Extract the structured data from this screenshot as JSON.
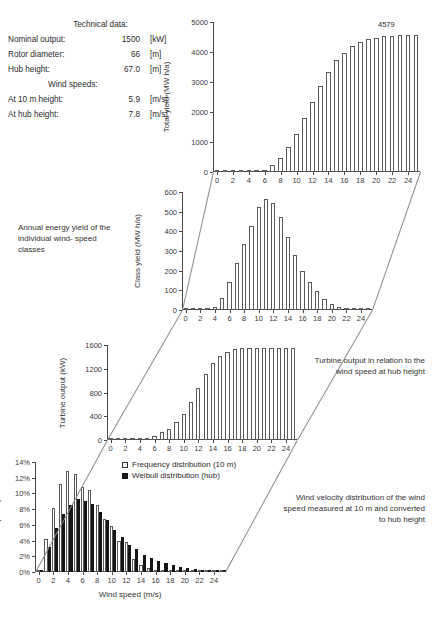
{
  "technical_data": {
    "heading": "Technical data:",
    "rows": [
      {
        "label": "Nominal output:",
        "value": "1500",
        "unit": "[kW]"
      },
      {
        "label": "Rotor diameter:",
        "value": "66",
        "unit": "[m]"
      },
      {
        "label": "Hub height:",
        "value": "67.0",
        "unit": "[m]"
      }
    ],
    "wind_heading": "Wind speeds:",
    "wind_rows": [
      {
        "label": "At 10 m height:",
        "value": "5.9",
        "unit": "[m/s]"
      },
      {
        "label": "At hub height:",
        "value": "7.8",
        "unit": "[m/s]"
      }
    ]
  },
  "notes": {
    "annual_energy": "Annual energy\nyield of the\nindividual wind-\nspeed classes",
    "turbine_output": "Turbine output\nin relation to\nthe wind speed\nat hub height",
    "wind_velocity": "Wind velocity distribution of\nthe wind speed measured\nat 10 m and converted\nto hub height"
  },
  "legend": {
    "frequency_label": "Frequency distribution (10 m)",
    "weibull_label": "Weibull distribution (hub)",
    "frequency_color": "#ffffff",
    "weibull_color": "#151515"
  },
  "chart_data": [
    {
      "id": "total-yield",
      "type": "bar",
      "title": "",
      "xlabel": "",
      "ylabel": "Total yield (MW h/a)",
      "ylim": [
        0,
        5000
      ],
      "yticks": [
        0,
        1000,
        2000,
        3000,
        4000,
        5000
      ],
      "xlim": [
        -0.5,
        25.5
      ],
      "xticks": [
        0,
        2,
        4,
        6,
        8,
        10,
        12,
        14,
        16,
        18,
        20,
        22,
        24
      ],
      "grid": false,
      "annotation": "4579",
      "categories": [
        0,
        1,
        2,
        3,
        4,
        5,
        6,
        7,
        8,
        9,
        10,
        11,
        12,
        13,
        14,
        15,
        16,
        17,
        18,
        19,
        20,
        21,
        22,
        23,
        24,
        25
      ],
      "values": [
        0,
        0,
        1,
        3,
        8,
        24,
        78,
        218,
        455,
        830,
        1270,
        1800,
        2340,
        2880,
        3350,
        3720,
        3980,
        4190,
        4330,
        4420,
        4480,
        4520,
        4545,
        4560,
        4572,
        4579
      ]
    },
    {
      "id": "class-yield",
      "type": "bar",
      "title": "",
      "xlabel": "",
      "ylabel": "Class yield (MW h/a)",
      "ylim": [
        0,
        600
      ],
      "yticks": [
        0,
        100,
        200,
        300,
        400,
        500,
        600
      ],
      "xlim": [
        -0.5,
        25.5
      ],
      "xticks": [
        0,
        2,
        4,
        6,
        8,
        10,
        12,
        14,
        16,
        18,
        20,
        22,
        24
      ],
      "grid": false,
      "categories": [
        0,
        1,
        2,
        3,
        4,
        5,
        6,
        7,
        8,
        9,
        10,
        11,
        12,
        13,
        14,
        15,
        16,
        17,
        18,
        19,
        20,
        21,
        22,
        23,
        24,
        25
      ],
      "values": [
        0,
        1,
        2,
        5,
        17,
        62,
        140,
        238,
        335,
        428,
        525,
        565,
        545,
        472,
        372,
        278,
        200,
        140,
        95,
        58,
        30,
        17,
        10,
        7,
        6,
        5
      ]
    },
    {
      "id": "turbine-output",
      "type": "bar",
      "title": "",
      "xlabel": "",
      "ylabel": "Turbine output (kW)",
      "ylim": [
        0,
        1600
      ],
      "yticks": [
        0,
        400,
        800,
        1200,
        1600
      ],
      "xlim": [
        -0.5,
        25.5
      ],
      "xticks": [
        0,
        2,
        4,
        6,
        8,
        10,
        12,
        14,
        16,
        18,
        20,
        22,
        24
      ],
      "grid": false,
      "categories": [
        0,
        1,
        2,
        3,
        4,
        5,
        6,
        7,
        8,
        9,
        10,
        11,
        12,
        13,
        14,
        15,
        16,
        17,
        18,
        19,
        20,
        21,
        22,
        23,
        24,
        25
      ],
      "values": [
        0,
        0,
        0,
        0,
        5,
        20,
        70,
        130,
        190,
        300,
        440,
        640,
        870,
        1120,
        1290,
        1420,
        1490,
        1530,
        1545,
        1545,
        1545,
        1545,
        1545,
        1545,
        1545,
        1545
      ]
    },
    {
      "id": "wind-frequency",
      "type": "bar",
      "title": "",
      "xlabel": "Wind speed (m/s)",
      "ylabel": "Frequency",
      "ylim": [
        0,
        14
      ],
      "yticks": [
        "0%",
        "2%",
        "4%",
        "6%",
        "8%",
        "10%",
        "12%",
        "14%"
      ],
      "ytick_values": [
        0,
        2,
        4,
        6,
        8,
        10,
        12,
        14
      ],
      "xlim": [
        -0.5,
        25.5
      ],
      "xticks": [
        0,
        2,
        4,
        6,
        8,
        10,
        12,
        14,
        16,
        18,
        20,
        22,
        24
      ],
      "grid": false,
      "categories": [
        0,
        1,
        2,
        3,
        4,
        5,
        6,
        7,
        8,
        9,
        10,
        11,
        12,
        13,
        14,
        15,
        16,
        17,
        18,
        19,
        20,
        21,
        22,
        23,
        24,
        25
      ],
      "series": [
        {
          "name": "Frequency distribution (10 m)",
          "values": [
            0.2,
            4.2,
            8.2,
            11.2,
            12.8,
            12.5,
            10.8,
            10.4,
            8.5,
            6.7,
            5.9,
            4.0,
            3.8,
            1.6,
            0.9,
            0.5,
            0.3,
            0.2,
            0.15,
            0.1,
            0.08,
            0.05,
            0.04,
            0.03,
            0.02,
            0.01
          ]
        },
        {
          "name": "Weibull distribution (hub)",
          "values": [
            0.1,
            3.2,
            5.6,
            7.4,
            8.5,
            9.3,
            9.1,
            8.6,
            7.7,
            6.6,
            5.4,
            4.4,
            3.5,
            2.9,
            2.2,
            1.8,
            1.4,
            1.1,
            0.85,
            0.65,
            0.5,
            0.38,
            0.28,
            0.2,
            0.15,
            0.1
          ]
        }
      ]
    }
  ]
}
